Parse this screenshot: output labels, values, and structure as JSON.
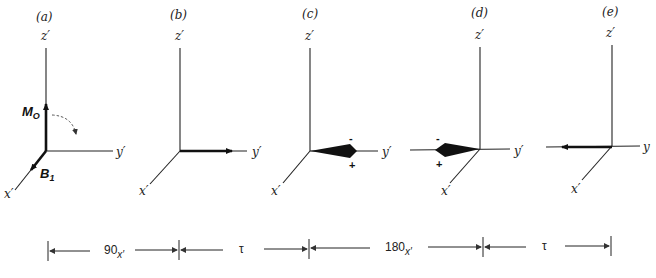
{
  "panels": [
    {
      "id": "a",
      "label": "(a)",
      "z_label": "z′",
      "y_label": "y′",
      "x_label": "x′",
      "vectors": [
        "M_O along z′",
        "B_1 along x′"
      ],
      "mo_label": "M",
      "mo_sub": "O",
      "b1_label": "B",
      "b1_sub": "1"
    },
    {
      "id": "b",
      "label": "(b)",
      "z_label": "z′",
      "y_label": "y′",
      "x_label": "x′",
      "vectors": [
        "magnetization along +y′"
      ]
    },
    {
      "id": "c",
      "label": "(c)",
      "z_label": "z′",
      "y_label": "y′",
      "x_label": "x′",
      "minus": "-",
      "plus": "+",
      "vectors": [
        "dephasing fan along +y′"
      ]
    },
    {
      "id": "d",
      "label": "(d)",
      "z_label": "z′",
      "y_label": "y′",
      "x_label": "x′",
      "minus": "-",
      "plus": "+",
      "vectors": [
        "dephasing fan along −y′"
      ]
    },
    {
      "id": "e",
      "label": "(e)",
      "z_label": "z′",
      "y_label": "y",
      "x_label": "x′",
      "vectors": [
        "refocused echo along −y′"
      ]
    }
  ],
  "timeline": {
    "segments": [
      {
        "main": "90",
        "sub": "x′"
      },
      {
        "main": "τ",
        "sub": ""
      },
      {
        "main": "180",
        "sub": "x′"
      },
      {
        "main": "τ",
        "sub": ""
      }
    ]
  },
  "colors": {
    "ink": "#222222",
    "background": "#ffffff"
  }
}
